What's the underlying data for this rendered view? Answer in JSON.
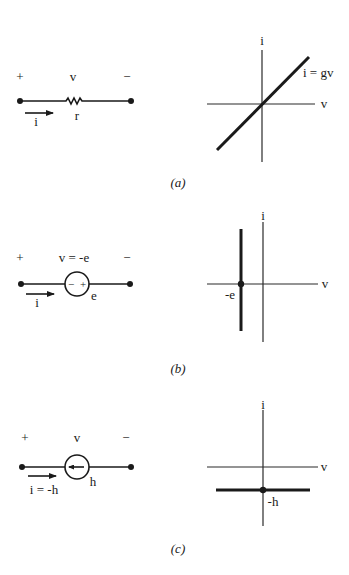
{
  "panels": [
    {
      "id": "a",
      "caption": "(a)",
      "circuit": {
        "element": "resistor",
        "plus": "+",
        "voltage_label": "v",
        "minus": "−",
        "current_label": "i",
        "element_label": "r"
      },
      "graph": {
        "x_axis_label": "v",
        "y_axis_label": "i",
        "curve_label": "i = gv",
        "curve_type": "line through origin, positive slope"
      }
    },
    {
      "id": "b",
      "caption": "(b)",
      "circuit": {
        "element": "voltage-source",
        "plus": "+",
        "voltage_label": "v = -e",
        "minus": "−",
        "current_label": "i",
        "element_label": "e",
        "source_inner_minus": "−",
        "source_inner_plus": "+"
      },
      "graph": {
        "x_axis_label": "v",
        "y_axis_label": "i",
        "point_label": "-e",
        "curve_type": "vertical line at v = -e"
      }
    },
    {
      "id": "c",
      "caption": "(c)",
      "circuit": {
        "element": "current-source",
        "plus": "+",
        "voltage_label": "v",
        "minus": "−",
        "current_label": "i = -h",
        "element_label": "h"
      },
      "graph": {
        "x_axis_label": "v",
        "y_axis_label": "i",
        "point_label": "-h",
        "curve_type": "horizontal line at i = -h"
      }
    }
  ]
}
